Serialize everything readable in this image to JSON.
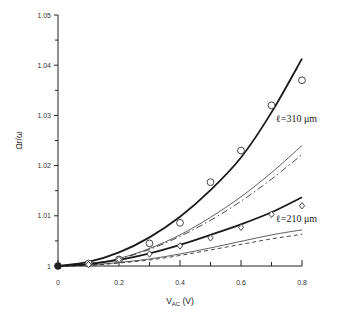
{
  "chart_data": {
    "type": "line",
    "title": "",
    "xlabel": "V_AC (V)",
    "xlabel_main": "V",
    "xlabel_sub": "AC",
    "xlabel_unit": " (V)",
    "ylabel": "Ωr/ω",
    "xlim": [
      0,
      0.8
    ],
    "ylim": [
      1,
      1.05
    ],
    "x_ticks": [
      0,
      0.2,
      0.4,
      0.6,
      0.8
    ],
    "x_tick_labels": [
      "0",
      "0.2",
      "0.4",
      "0.6",
      "0.8"
    ],
    "x_minor_ticks": [
      0.1,
      0.3,
      0.5,
      0.7
    ],
    "y_ticks": [
      1,
      1.01,
      1.02,
      1.03,
      1.04,
      1.05
    ],
    "y_tick_labels": [
      "1",
      "1.01",
      "1.02",
      "1.03",
      "1.04",
      "1.05"
    ],
    "y_minor_ticks": [
      1.005,
      1.015,
      1.025,
      1.035,
      1.045
    ],
    "grid": false,
    "annotations": [
      {
        "text": "ℓ=310 μm",
        "x": 0.79,
        "y": 1.0295
      },
      {
        "text": "ℓ=210 μm",
        "x": 0.79,
        "y": 1.0095
      }
    ],
    "series": [
      {
        "name": "ℓ=310 μm theory (thick)",
        "style": "thick-solid",
        "x": [
          0,
          0.1,
          0.2,
          0.3,
          0.4,
          0.5,
          0.6,
          0.7,
          0.8
        ],
        "y": [
          1,
          1.0008,
          1.0027,
          1.0057,
          1.0098,
          1.0151,
          1.0216,
          1.0306,
          1.0413
        ]
      },
      {
        "name": "ℓ=310 μm experiment",
        "style": "circle-markers",
        "x": [
          0,
          0.1,
          0.2,
          0.3,
          0.4,
          0.5,
          0.6,
          0.7,
          0.8
        ],
        "y": [
          1,
          1.0005,
          1.0013,
          1.0045,
          1.0086,
          1.0167,
          1.023,
          1.032,
          1.037
        ]
      },
      {
        "name": "ℓ=310 μm model (thin)",
        "style": "thin-solid",
        "x": [
          0,
          0.1,
          0.2,
          0.3,
          0.4,
          0.5,
          0.6,
          0.7,
          0.8
        ],
        "y": [
          1,
          1.0004,
          1.0015,
          1.0035,
          1.0062,
          1.0097,
          1.0138,
          1.0186,
          1.024
        ]
      },
      {
        "name": "ℓ=310 μm model (dash-dot)",
        "style": "dash-dot",
        "x": [
          0,
          0.1,
          0.2,
          0.3,
          0.4,
          0.5,
          0.6,
          0.7,
          0.8
        ],
        "y": [
          1,
          1.0004,
          1.0014,
          1.0033,
          1.0059,
          1.0091,
          1.0129,
          1.0173,
          1.0222
        ]
      },
      {
        "name": "ℓ=210 μm theory (thick)",
        "style": "thick-solid",
        "x": [
          0,
          0.1,
          0.2,
          0.3,
          0.4,
          0.5,
          0.6,
          0.7,
          0.8
        ],
        "y": [
          1,
          1.0004,
          1.0012,
          1.0025,
          1.0042,
          1.0062,
          1.0083,
          1.0107,
          1.0137
        ]
      },
      {
        "name": "ℓ=210 μm experiment",
        "style": "diamond-markers",
        "x": [
          0,
          0.1,
          0.2,
          0.3,
          0.4,
          0.5,
          0.6,
          0.7,
          0.8
        ],
        "y": [
          1,
          1.0003,
          1.0013,
          1.0024,
          1.004,
          1.0056,
          1.0077,
          1.0103,
          1.012
        ]
      },
      {
        "name": "ℓ=210 μm model (thin)",
        "style": "thin-solid",
        "x": [
          0,
          0.1,
          0.2,
          0.3,
          0.4,
          0.5,
          0.6,
          0.7,
          0.8
        ],
        "y": [
          1,
          1.0002,
          1.0007,
          1.0014,
          1.0024,
          1.0036,
          1.0049,
          1.0062,
          1.0072
        ]
      },
      {
        "name": "ℓ=210 μm model (dashed)",
        "style": "dashed",
        "x": [
          0,
          0.1,
          0.2,
          0.3,
          0.4,
          0.5,
          0.6,
          0.7,
          0.8
        ],
        "y": [
          1,
          1.0001,
          1.0006,
          1.0012,
          1.0021,
          1.0032,
          1.0043,
          1.0054,
          1.0063
        ]
      }
    ]
  },
  "layout": {
    "plot_left": 58,
    "plot_right": 302,
    "plot_top": 15,
    "plot_bottom": 266
  }
}
